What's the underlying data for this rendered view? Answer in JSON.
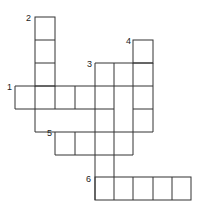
{
  "puzzle": {
    "type": "crossword",
    "clue_numbers": [
      {
        "label": "1",
        "x": 7,
        "y": 86,
        "direction": "across",
        "length": 7
      },
      {
        "label": "2",
        "x": 26,
        "y": 16,
        "direction": "down",
        "length": 5
      },
      {
        "label": "3",
        "x": 87,
        "y": 62,
        "direction": "down",
        "length": 6
      },
      {
        "label": "4",
        "x": 127,
        "y": 39,
        "direction": "down",
        "length": 4
      },
      {
        "label": "5",
        "x": 47,
        "y": 131,
        "direction": "across",
        "length": 4
      },
      {
        "label": "6",
        "x": 86,
        "y": 177,
        "direction": "across",
        "length": 5
      }
    ],
    "line_color": "#333333",
    "background": "#ffffff"
  }
}
